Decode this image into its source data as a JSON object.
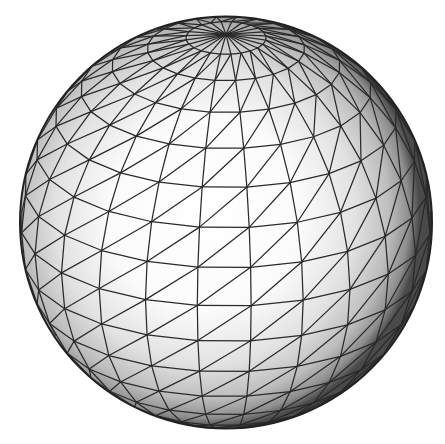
{
  "figure": {
    "title": "Triangulated sphere mesh",
    "background": "#ffffff"
  },
  "sphere": {
    "center_x": 226,
    "center_y": 222.5,
    "radius": 206,
    "tilt_deg": 24,
    "rotation_deg": 8,
    "latitude_bands": 16,
    "longitude_segments": 24,
    "diagonal_split": true,
    "shading": {
      "highlight_offset_x": -0.05,
      "highlight_offset_y": -0.02,
      "stops": [
        {
          "offset": "0%",
          "color": "#ffffff"
        },
        {
          "offset": "45%",
          "color": "#fbfbfb"
        },
        {
          "offset": "70%",
          "color": "#e2e2e2"
        },
        {
          "offset": "86%",
          "color": "#bdbdbd"
        },
        {
          "offset": "95%",
          "color": "#8e8e8e"
        },
        {
          "offset": "100%",
          "color": "#4a4a4a"
        }
      ]
    },
    "edge_color": "#2a2a2a",
    "edge_width": 1.25,
    "outline_color": "#222222",
    "outline_width": 2
  }
}
